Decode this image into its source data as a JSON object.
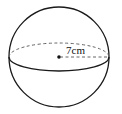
{
  "diagram": {
    "type": "sphere",
    "radius_label": "7cm",
    "stroke_color": "#1a1a1a",
    "dashed_color": "#555555"
  }
}
